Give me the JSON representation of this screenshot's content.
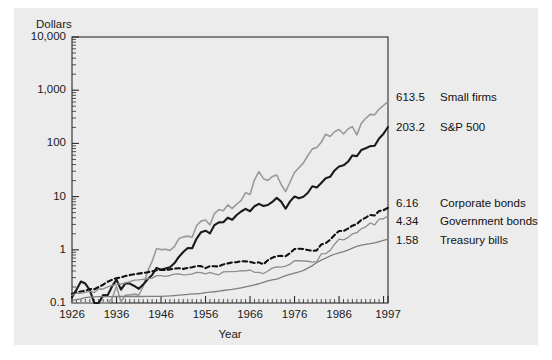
{
  "chart_data": {
    "type": "line",
    "title": "",
    "subtitle": "",
    "ylabel": "Dollars",
    "xlabel": "Year",
    "scale": "log",
    "grid": false,
    "legend_position": "right-endpoint-labels",
    "xlim": [
      1926,
      1997
    ],
    "ylim": [
      0.1,
      10000
    ],
    "ytick_labels": [
      "10,000",
      "1,000",
      "100",
      "10",
      "1",
      "0.1"
    ],
    "ytick_values": [
      10000,
      1000,
      100,
      10,
      1,
      0.1
    ],
    "xtick_labels": [
      "1926",
      "1936",
      "1946",
      "1956",
      "1966",
      "1976",
      "1986",
      "1997"
    ],
    "xtick_values": [
      1926,
      1936,
      1946,
      1956,
      1966,
      1976,
      1986,
      1997
    ],
    "x": [
      1926,
      1927,
      1928,
      1929,
      1930,
      1931,
      1932,
      1933,
      1934,
      1935,
      1936,
      1937,
      1938,
      1939,
      1940,
      1941,
      1942,
      1943,
      1944,
      1945,
      1946,
      1947,
      1948,
      1949,
      1950,
      1951,
      1952,
      1953,
      1954,
      1955,
      1956,
      1957,
      1958,
      1959,
      1960,
      1961,
      1962,
      1963,
      1964,
      1965,
      1966,
      1967,
      1968,
      1969,
      1970,
      1971,
      1972,
      1973,
      1974,
      1975,
      1976,
      1977,
      1978,
      1979,
      1980,
      1981,
      1982,
      1983,
      1984,
      1985,
      1986,
      1987,
      1988,
      1989,
      1990,
      1991,
      1992,
      1993,
      1994,
      1995,
      1996,
      1997
    ],
    "series": [
      {
        "name": "Small firms",
        "end_value": "613.5",
        "end_value_numeric": 613.5,
        "color": "#9a9a9a",
        "style": "solid",
        "width": 1.6,
        "values": [
          1.0,
          1.22,
          1.94,
          1.02,
          0.56,
          0.28,
          0.31,
          1.79,
          2.23,
          3.52,
          5.99,
          3.02,
          4.06,
          4.13,
          4.26,
          4.08,
          5.99,
          11.5,
          17.6,
          30.6,
          29.2,
          29.6,
          28.3,
          33.3,
          46.6,
          50.8,
          52.4,
          50.1,
          83.2,
          100.4,
          105.6,
          85.2,
          139.4,
          165.3,
          157.0,
          202.6,
          173.3,
          209.6,
          244.0,
          344.0,
          319.0,
          600.0,
          853.0,
          630.0,
          584.0,
          690.0,
          740.0,
          490.0,
          360.0,
          545.0,
          830.0,
          1010.0,
          1250.0,
          1720.0,
          2290.0,
          2440.0,
          3050.0,
          4310.0,
          3910.0,
          4790.0,
          5310.0,
          4360.0,
          5400.0,
          6000.0,
          4200.0,
          6900.0,
          8600.0,
          10200.0,
          10000.0,
          12800.0,
          15000.0,
          17800.0
        ],
        "display_scaled": true,
        "note": "plotted as cumulative value of $1 invested at year-end 1925; final value 613.5 on the displayed scale"
      },
      {
        "name": "S&P 500",
        "end_value": "203.2",
        "end_value_numeric": 203.2,
        "color": "#1a1a1a",
        "style": "solid",
        "width": 2.1,
        "values": [
          1.0,
          1.37,
          1.96,
          1.8,
          1.35,
          0.77,
          0.71,
          1.09,
          1.08,
          1.59,
          2.13,
          1.38,
          1.81,
          1.8,
          1.62,
          1.43,
          1.72,
          2.17,
          2.6,
          3.55,
          3.26,
          3.44,
          3.63,
          4.32,
          5.69,
          7.06,
          8.36,
          8.28,
          12.63,
          16.62,
          17.71,
          15.79,
          22.65,
          25.37,
          25.49,
          31.13,
          28.42,
          34.9,
          40.67,
          45.72,
          41.12,
          50.98,
          56.6,
          51.8,
          53.9,
          61.6,
          73.3,
          62.5,
          45.9,
          63.0,
          78.1,
          72.5,
          77.3,
          91.6,
          121.3,
          115.3,
          140.1,
          171.7,
          182.6,
          240.6,
          285.4,
          300.3,
          350.1,
          460.9,
          446.6,
          582.6,
          627.0,
          690.0,
          699.0,
          961.0,
          1182.0,
          1576.0
        ],
        "display_scaled": true,
        "note": "plotted as cumulative value of $1; final value 203.2 on the displayed scale"
      },
      {
        "name": "Corporate bonds",
        "end_value": "6.16",
        "end_value_numeric": 6.16,
        "color": "#111111",
        "style": "dashed",
        "width": 2.1,
        "values": [
          1.0,
          1.07,
          1.11,
          1.15,
          1.24,
          1.22,
          1.35,
          1.49,
          1.69,
          1.85,
          1.98,
          2.04,
          2.17,
          2.26,
          2.34,
          2.41,
          2.48,
          2.55,
          2.67,
          2.79,
          2.84,
          2.8,
          2.89,
          2.99,
          3.05,
          2.96,
          3.07,
          3.18,
          3.35,
          3.33,
          3.06,
          3.33,
          3.32,
          3.29,
          3.59,
          3.75,
          3.92,
          3.94,
          4.13,
          4.1,
          4.01,
          3.81,
          3.92,
          3.61,
          4.29,
          4.8,
          5.14,
          5.19,
          5.13,
          5.88,
          6.97,
          7.06,
          6.98,
          6.68,
          6.46,
          6.59,
          8.52,
          9.0,
          10.44,
          12.83,
          15.24,
          15.2,
          16.87,
          19.17,
          20.6,
          24.57,
          27.24,
          30.5,
          29.74,
          36.15,
          37.5,
          41.6
        ],
        "display_scaled": true,
        "note": "long-term corporate bonds; final value 6.16 on the displayed scale"
      },
      {
        "name": "Government bonds",
        "end_value": "4.34",
        "end_value_numeric": 4.34,
        "color": "#8e8e8e",
        "style": "solid",
        "width": 1.3,
        "values": [
          1.0,
          1.09,
          1.09,
          1.13,
          1.18,
          1.12,
          1.31,
          1.31,
          1.44,
          1.51,
          1.62,
          1.62,
          1.71,
          1.81,
          1.92,
          1.94,
          1.99,
          2.04,
          2.1,
          2.33,
          2.33,
          2.27,
          2.35,
          2.5,
          2.51,
          2.41,
          2.44,
          2.52,
          2.7,
          2.66,
          2.51,
          2.69,
          2.52,
          2.42,
          2.75,
          2.78,
          2.77,
          2.8,
          2.9,
          2.88,
          2.98,
          2.7,
          2.68,
          2.54,
          2.85,
          3.23,
          3.4,
          3.38,
          3.52,
          3.83,
          4.47,
          4.45,
          4.4,
          4.35,
          4.2,
          4.29,
          5.98,
          6.04,
          6.97,
          9.1,
          11.32,
          11.0,
          12.11,
          14.2,
          14.96,
          17.78,
          19.33,
          22.78,
          21.0,
          27.0,
          27.4,
          31.0
        ],
        "display_scaled": true,
        "note": "long-term government bonds; final value 4.34 on the displayed scale"
      },
      {
        "name": "Treasury bills",
        "end_value": "1.58",
        "end_value_numeric": 1.58,
        "color": "#7e7e7e",
        "style": "solid",
        "width": 1.3,
        "values": [
          1.0,
          1.03,
          1.07,
          1.12,
          1.15,
          1.16,
          1.17,
          1.17,
          1.17,
          1.17,
          1.18,
          1.18,
          1.18,
          1.18,
          1.18,
          1.18,
          1.18,
          1.19,
          1.19,
          1.19,
          1.19,
          1.2,
          1.21,
          1.23,
          1.25,
          1.27,
          1.29,
          1.32,
          1.33,
          1.35,
          1.39,
          1.43,
          1.45,
          1.49,
          1.53,
          1.57,
          1.61,
          1.66,
          1.72,
          1.79,
          1.87,
          1.95,
          2.05,
          2.18,
          2.32,
          2.42,
          2.51,
          2.69,
          2.91,
          3.09,
          3.25,
          3.41,
          3.65,
          4.03,
          4.49,
          5.15,
          5.71,
          6.21,
          6.82,
          7.35,
          7.81,
          8.24,
          8.81,
          9.55,
          10.3,
          10.88,
          11.26,
          11.59,
          12.05,
          12.72,
          13.38,
          14.08
        ],
        "display_scaled": true,
        "note": "30-day U.S. Treasury bills; final value 1.58 on the displayed scale"
      }
    ]
  }
}
